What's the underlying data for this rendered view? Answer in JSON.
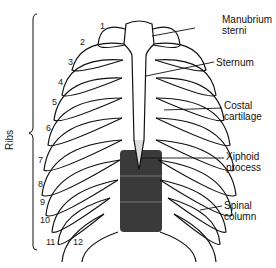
{
  "diagram": {
    "group_label": "Ribs",
    "labels": {
      "manubrium": [
        "Manubrium",
        "sterni"
      ],
      "sternum": "Sternum",
      "costal": [
        "Costal",
        "cartilage"
      ],
      "xiphoid": [
        "Xiphoid",
        "process"
      ],
      "spinal": [
        "Spinal",
        "column"
      ]
    },
    "rib_numbers": [
      "1",
      "2",
      "3",
      "4",
      "5",
      "6",
      "7",
      "8",
      "9",
      "10",
      "11",
      "12"
    ],
    "colors": {
      "ink": "#111111",
      "shade": "#444444",
      "bone": "#ffffff"
    }
  }
}
